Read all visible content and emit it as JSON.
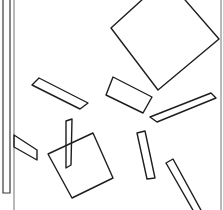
{
  "canvas": {
    "width": 223,
    "height": 210,
    "background": "#ffffff",
    "stroke": "#1e1e1e",
    "frame_stroke": "#8a8a8a"
  },
  "frame": {
    "left_panel": {
      "points": "3,-2 10,-2 10,193 3,193"
    },
    "left_line": {
      "x1": 14,
      "y1": 0,
      "x2": 14,
      "y2": 210
    },
    "right_line": {
      "x1": 221,
      "y1": 0,
      "x2": 221,
      "y2": 210
    }
  },
  "shapes": [
    {
      "name": "large-square",
      "points": "166,-22 219,39 158,90 111,28"
    },
    {
      "name": "small-rectangle",
      "points": "113,77 152,97 143,113 106,95"
    },
    {
      "name": "left-diagonal-strip",
      "points": "32,85 39,78 88,103 80,109"
    },
    {
      "name": "right-diagonal-strip",
      "points": "150,117 211,93 216,98 157,122"
    },
    {
      "name": "left-edge-parallelogram",
      "points": "14,135 37,150 37,160 14,147"
    },
    {
      "name": "tilted-square",
      "points": "48,154 93,133 113,178 72,198"
    },
    {
      "name": "vertical-strip",
      "points": "66,121 72,119 71,165 66,168"
    },
    {
      "name": "bottom-right-strip-short",
      "points": "137,133 145,131 155,178 147,179"
    },
    {
      "name": "bottom-right-strip-long",
      "points": "166,163 173,159 202,212 194,212"
    }
  ]
}
